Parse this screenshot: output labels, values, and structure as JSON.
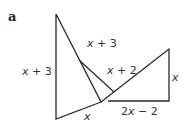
{
  "figure": {
    "part_label": "a",
    "labels": {
      "left_side": "x + 3",
      "top_hyp": "x + 3",
      "inner_segment": "x + 2",
      "bottom_left": "x",
      "right_side": "x",
      "bottom_right": "2x − 2"
    },
    "stroke_color": "#2a2a2a",
    "text_color": "#333333"
  }
}
